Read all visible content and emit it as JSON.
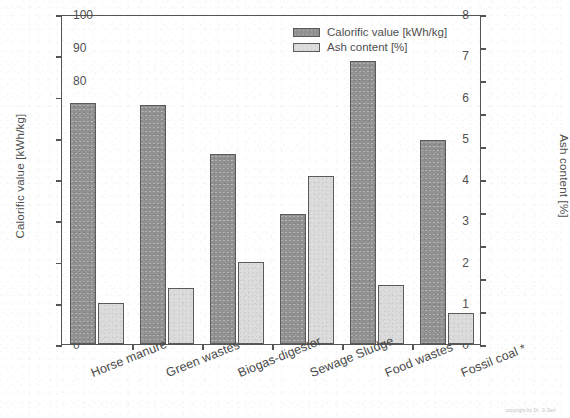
{
  "chart_data": {
    "type": "bar",
    "title": "",
    "subtitle": "",
    "categories": [
      "Horse manure",
      "Green wastes",
      "Biogas-digester",
      "Sewage Sludge",
      "Food wastes",
      "Fossil coal *"
    ],
    "series": [
      {
        "name": "Calorific value [kWh/kg]",
        "axis": "left",
        "color": "#919191",
        "values": [
          5.85,
          5.8,
          4.6,
          3.15,
          6.85,
          4.95
        ]
      },
      {
        "name": "Ash content [%]",
        "axis": "right",
        "color": "#dcdcdc",
        "values": [
          12.5,
          17.0,
          25.0,
          51.0,
          18.0,
          9.5
        ]
      }
    ],
    "xlabel": "",
    "ylabel": "Calorific value [kWh/kg]",
    "y2label": "Ash content [%]",
    "ylim": [
      0,
      8
    ],
    "y2lim": [
      0,
      100
    ],
    "yticks": [
      "0",
      "1",
      "2",
      "3",
      "4",
      "5",
      "6",
      "7",
      "8"
    ],
    "y2ticks": [
      "0",
      "10",
      "20",
      "30",
      "40",
      "50",
      "60",
      "70",
      "80",
      "90",
      "100"
    ],
    "grid": false,
    "legend_position": "top-right",
    "category_label_rotation": -22
  },
  "legend": {
    "items": [
      {
        "label": "Calorific value [kWh/kg]",
        "swatch": "calorific"
      },
      {
        "label": "Ash content [%]",
        "swatch": "ash"
      }
    ]
  },
  "footer": {
    "copyright": "copyright by Dr. G.Seri"
  },
  "colors": {
    "calorific_bar": "#919191",
    "ash_bar": "#dcdcdc",
    "axis": "#555555",
    "text": "#4f4f4f",
    "background": "#ffffff"
  }
}
